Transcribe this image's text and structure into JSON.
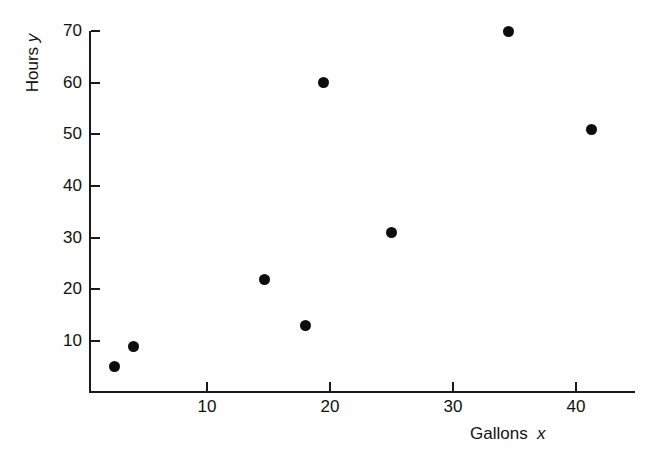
{
  "chart_data": {
    "type": "scatter",
    "title": "",
    "xlabel": "Gallons x",
    "ylabel": "Hours y",
    "xlabel_text": "Gallons",
    "xlabel_var": "x",
    "ylabel_text": "Hours",
    "ylabel_var": "y",
    "xlim": [
      0,
      44
    ],
    "ylim": [
      0,
      73
    ],
    "xticks": [
      10,
      20,
      30,
      40
    ],
    "yticks": [
      10,
      20,
      30,
      40,
      50,
      60,
      70
    ],
    "xtick_labels": [
      "10",
      "20",
      "30",
      "40"
    ],
    "ytick_labels": [
      "10",
      "20",
      "30",
      "40",
      "50",
      "60",
      "70"
    ],
    "grid": false,
    "legend": false,
    "marker": "filled-circle",
    "marker_color": "#0d0d0d",
    "points": [
      {
        "x": 2.5,
        "y": 5
      },
      {
        "x": 4.0,
        "y": 9
      },
      {
        "x": 14.7,
        "y": 22
      },
      {
        "x": 18.0,
        "y": 13
      },
      {
        "x": 19.5,
        "y": 60
      },
      {
        "x": 25.0,
        "y": 31
      },
      {
        "x": 34.5,
        "y": 70
      },
      {
        "x": 41.3,
        "y": 51
      }
    ],
    "x": [
      2.5,
      4.0,
      14.7,
      18.0,
      19.5,
      25.0,
      34.5,
      41.3
    ],
    "values": [
      5,
      9,
      22,
      13,
      60,
      31,
      70,
      51
    ]
  }
}
